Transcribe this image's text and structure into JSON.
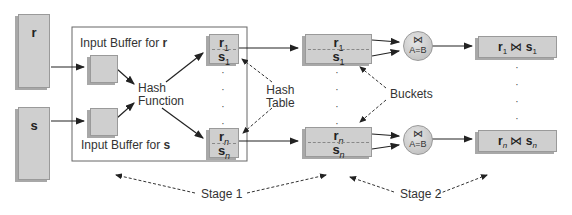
{
  "relations": {
    "r": "r",
    "s": "s"
  },
  "stage1_frame": {
    "buffer_r_label": "Input Buffer for ",
    "buffer_r_rel": "r",
    "buffer_s_label": "Input Buffer for ",
    "buffer_s_rel": "s",
    "hash_function_line1": "Hash",
    "hash_function_line2": "Function"
  },
  "hash_table": {
    "label_line1": "Hash",
    "label_line2": "Table",
    "top": {
      "r": "r",
      "r_sub": "1",
      "s": "s",
      "s_sub": "1"
    },
    "bottom": {
      "r": "r",
      "r_sub": "n",
      "s": "s",
      "s_sub": "n"
    },
    "dots": "· · · ·"
  },
  "buckets": {
    "label": "Buckets",
    "top": {
      "r": "r",
      "r_sub": "1",
      "s": "s",
      "s_sub": "1"
    },
    "bottom": {
      "r": "r",
      "r_sub": "n",
      "s": "s",
      "s_sub": "n"
    }
  },
  "join_ops": {
    "symbol": "⋈",
    "condition": "A=B"
  },
  "results": {
    "top": {
      "r": "r",
      "r_sub": "1",
      "join": "⋈",
      "s": "s",
      "s_sub": "1"
    },
    "bottom": {
      "r": "r",
      "r_sub": "n",
      "join": "⋈",
      "s": "s",
      "s_sub": "n"
    }
  },
  "stages": {
    "stage1": "Stage 1",
    "stage2": "Stage 2"
  }
}
